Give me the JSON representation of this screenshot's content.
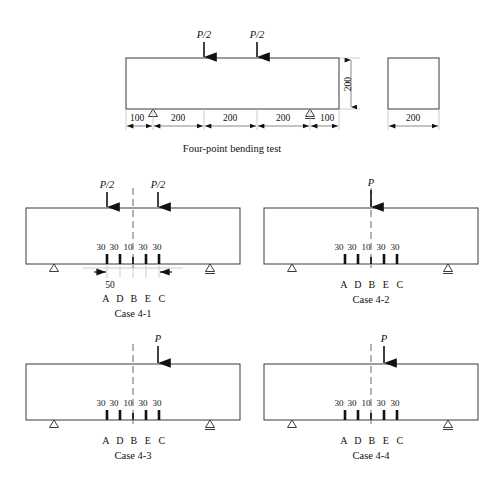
{
  "figure": {
    "title_top": "Four-point bending test",
    "load_half": "P/2",
    "load_full": "P",
    "gauge_points": [
      "A",
      "D",
      "B",
      "E",
      "C"
    ],
    "gauge_spacings": [
      "30",
      "30",
      "10",
      "30",
      "30"
    ],
    "gauge_total": "50"
  },
  "top_beam": {
    "depth_label": "200",
    "dims": [
      "100",
      "200",
      "200",
      "200",
      "100"
    ],
    "loads": [
      "P/2",
      "P/2"
    ],
    "caption": "Four-point bending test"
  },
  "cross_section": {
    "width_label": "200"
  },
  "cases": [
    {
      "id": "case-4-1",
      "label": "Case 4-1",
      "loads": [
        "P/2",
        "P/2"
      ],
      "load_count": 2,
      "gauge_spacings": [
        "30",
        "30",
        "10",
        "30",
        "30"
      ],
      "gauge_points": [
        "A",
        "D",
        "B",
        "E",
        "C"
      ],
      "extra_dim": "50",
      "has_extra_dim": true
    },
    {
      "id": "case-4-2",
      "label": "Case 4-2",
      "loads": [
        "P"
      ],
      "load_count": 1,
      "gauge_spacings": [
        "30",
        "30",
        "10",
        "30",
        "30"
      ],
      "gauge_points": [
        "A",
        "D",
        "B",
        "E",
        "C"
      ],
      "extra_dim": "",
      "has_extra_dim": false
    },
    {
      "id": "case-4-3",
      "label": "Case 4-3",
      "loads": [
        "P"
      ],
      "load_count": 1,
      "gauge_spacings": [
        "30",
        "30",
        "10",
        "30",
        "30"
      ],
      "gauge_points": [
        "A",
        "D",
        "B",
        "E",
        "C"
      ],
      "extra_dim": "",
      "has_extra_dim": false
    },
    {
      "id": "case-4-4",
      "label": "Case 4-4",
      "loads": [
        "P"
      ],
      "load_count": 1,
      "gauge_spacings": [
        "30",
        "30",
        "10",
        "30",
        "30"
      ],
      "gauge_points": [
        "A",
        "D",
        "B",
        "E",
        "C"
      ],
      "extra_dim": "",
      "has_extra_dim": false
    }
  ],
  "colors": {
    "stroke": "#3a3a3a",
    "ink": "#111111",
    "dim": "#6a6a6a",
    "background": "#ffffff"
  }
}
